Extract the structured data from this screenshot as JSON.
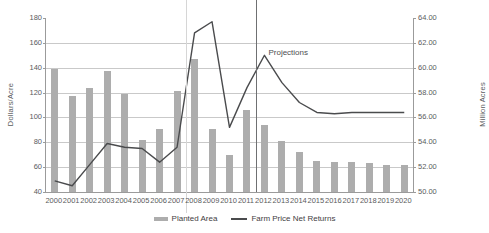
{
  "chart_data": {
    "type": "bar",
    "title": "",
    "subtitle": "",
    "xlabel": "",
    "ylabel": "Dollars/Acre",
    "y2label": "Million Acres",
    "ylim": [
      40,
      180
    ],
    "y2lim": [
      50.0,
      64.0
    ],
    "grid": true,
    "legend_position": "bottom",
    "categories": [
      "2000",
      "2001",
      "2002",
      "2003",
      "2004",
      "2005",
      "2006",
      "2007",
      "2008",
      "2009",
      "2010",
      "2011",
      "2012",
      "2013",
      "2014",
      "2015",
      "2016",
      "2017",
      "2018",
      "2019",
      "2020"
    ],
    "ytick_labels_left": [
      "40",
      "60",
      "80",
      "100",
      "120",
      "140",
      "160",
      "180"
    ],
    "ytick_labels_right": [
      "50.00",
      "52.00",
      "54.00",
      "56.00",
      "58.00",
      "60.00",
      "62.00",
      "64.00"
    ],
    "series": [
      {
        "name": "Planted Area",
        "type": "bar",
        "axis": "right",
        "unit": "Million Acres",
        "color": "#adadad",
        "values": [
          59.9,
          57.7,
          58.4,
          59.7,
          57.9,
          54.2,
          55.1,
          58.1,
          60.7,
          55.1,
          53.0,
          56.6,
          55.4,
          54.1,
          53.2,
          52.5,
          52.4,
          52.4,
          52.3,
          52.2,
          52.2
        ]
      },
      {
        "name": "Farm Price Net Returns",
        "type": "line",
        "axis": "left",
        "unit": "Dollars/Acre",
        "color": "#4a4b4d",
        "values": [
          49,
          45,
          62,
          79,
          76,
          75,
          64,
          76,
          168,
          177,
          92,
          124,
          150,
          128,
          112,
          104,
          103,
          104,
          104,
          104,
          104
        ]
      }
    ],
    "annotations": [
      {
        "text": "Projections",
        "x_category": "2012"
      }
    ],
    "dividers": [
      {
        "x_between": "2007|2008",
        "style": "light"
      },
      {
        "x_between": "2011|2012",
        "style": "dark"
      }
    ]
  },
  "legend": {
    "entries": [
      {
        "label": "Planted Area",
        "marker": "bar-swatch"
      },
      {
        "label": "Farm Price Net Returns",
        "marker": "line-swatch"
      }
    ]
  },
  "axes": {
    "left_title": "Dollars/Acre",
    "right_title": "Million Acres"
  },
  "annotation": {
    "projections": "Projections"
  }
}
